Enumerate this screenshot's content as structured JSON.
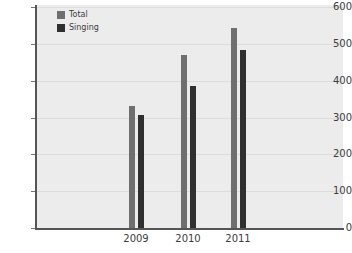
{
  "chart_data": {
    "type": "bar",
    "title": "",
    "subtitle": "",
    "xlabel": "",
    "ylabel": "",
    "categories": [
      "2009",
      "2010",
      "2011"
    ],
    "series": [
      {
        "name": "Total",
        "values": [
          331,
          470,
          543
        ],
        "color": "#6f6f6f"
      },
      {
        "name": "Singing",
        "values": [
          307,
          386,
          484
        ],
        "color": "#2f2f2f"
      }
    ],
    "ylim": [
      0,
      600
    ],
    "ytick_labels": [
      "600",
      "500",
      "400",
      "300",
      "200",
      "100",
      "0"
    ],
    "ytick_values": [
      600,
      500,
      400,
      300,
      200,
      100,
      0
    ],
    "grid": true,
    "legend_position": "top-left-inside",
    "plot_background": "#ececec",
    "gridline_color": "#dcdcdc",
    "axis_color": "#555555"
  },
  "legend": {
    "entries": [
      {
        "label": "Total",
        "color": "#6f6f6f"
      },
      {
        "label": "Singing",
        "color": "#2f2f2f"
      }
    ]
  }
}
